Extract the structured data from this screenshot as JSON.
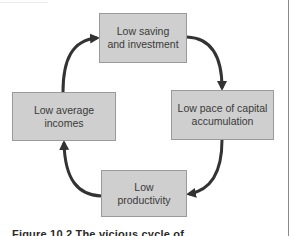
{
  "diagram": {
    "type": "cycle",
    "nodes": [
      {
        "id": "top",
        "line1": "Low saving",
        "line2": "and investment"
      },
      {
        "id": "right",
        "line1": "Low pace of capital",
        "line2": "accumulation"
      },
      {
        "id": "bottom",
        "line1": "Low",
        "line2": "productivity"
      },
      {
        "id": "left",
        "line1": "Low average",
        "line2": "incomes"
      }
    ],
    "edges": [
      {
        "from": "top",
        "to": "right"
      },
      {
        "from": "right",
        "to": "bottom"
      },
      {
        "from": "bottom",
        "to": "left"
      },
      {
        "from": "left",
        "to": "top"
      }
    ],
    "colors": {
      "box_fill": "#cfcfcf",
      "box_border": "#9a9a9a",
      "arrow": "#333333",
      "text": "#3a3a3a"
    }
  },
  "caption": "Figure 10.2  The vicious cycle of"
}
